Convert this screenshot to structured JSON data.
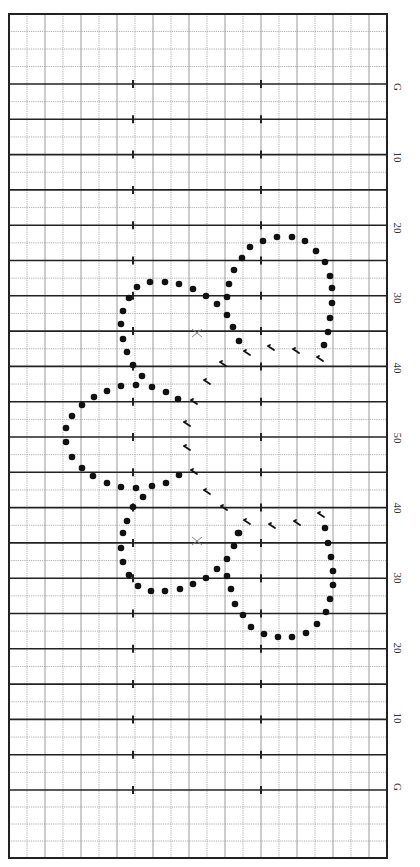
{
  "chart": {
    "type": "stitch-chart",
    "grid": {
      "left": 9,
      "top": 14,
      "right": 387,
      "bottom": 858,
      "column_count": 21,
      "row_top_area": 84,
      "thick_line_start": 84,
      "thick_line_end": 790,
      "thick_line_count": 21,
      "minor_rows_top": 4,
      "minor_rows_bottom": 4,
      "tick_columns_x": [
        133,
        261
      ],
      "colors": {
        "border": "#222222",
        "thick": "#222222",
        "minor": "#9a9a9a",
        "dot": "#111111"
      }
    },
    "row_labels": [
      {
        "text": "G",
        "y": 87
      },
      {
        "text": "10",
        "y": 157
      },
      {
        "text": "20",
        "y": 228
      },
      {
        "text": "30",
        "y": 298
      },
      {
        "text": "40",
        "y": 368
      },
      {
        "text": "50",
        "y": 438
      },
      {
        "text": "40",
        "y": 508
      },
      {
        "text": "30",
        "y": 578
      },
      {
        "text": "20",
        "y": 648
      },
      {
        "text": "10",
        "y": 718
      },
      {
        "text": "G",
        "y": 787
      }
    ],
    "symbols": {
      "dots": [
        [
          263,
          241
        ],
        [
          277,
          237
        ],
        [
          292,
          237
        ],
        [
          305,
          241
        ],
        [
          316,
          251
        ],
        [
          325,
          262
        ],
        [
          330,
          276
        ],
        [
          332,
          288
        ],
        [
          332,
          303
        ],
        [
          330,
          318
        ],
        [
          328,
          332
        ],
        [
          324,
          345
        ],
        [
          250,
          247
        ],
        [
          242,
          258
        ],
        [
          234,
          270
        ],
        [
          229,
          284
        ],
        [
          227,
          297
        ],
        [
          206,
          296
        ],
        [
          217,
          304
        ],
        [
          227,
          315
        ],
        [
          233,
          327
        ],
        [
          239,
          341
        ],
        [
          137,
          287
        ],
        [
          150,
          282
        ],
        [
          165,
          282
        ],
        [
          179,
          284
        ],
        [
          193,
          289
        ],
        [
          129,
          298
        ],
        [
          123,
          311
        ],
        [
          121,
          324
        ],
        [
          123,
          339
        ],
        [
          127,
          352
        ],
        [
          133,
          365
        ],
        [
          142,
          376
        ],
        [
          136,
          385
        ],
        [
          121,
          386
        ],
        [
          107,
          391
        ],
        [
          94,
          397
        ],
        [
          82,
          405
        ],
        [
          72,
          416
        ],
        [
          66,
          428
        ],
        [
          66,
          442
        ],
        [
          72,
          457
        ],
        [
          82,
          468
        ],
        [
          93,
          476
        ],
        [
          107,
          483
        ],
        [
          121,
          487
        ],
        [
          136,
          488
        ],
        [
          152,
          486
        ],
        [
          166,
          483
        ],
        [
          179,
          475
        ],
        [
          152,
          387
        ],
        [
          166,
          392
        ],
        [
          178,
          399
        ],
        [
          143,
          497
        ],
        [
          133,
          507
        ],
        [
          127,
          521
        ],
        [
          123,
          533
        ],
        [
          121,
          548
        ],
        [
          123,
          562
        ],
        [
          129,
          575
        ],
        [
          138,
          586
        ],
        [
          151,
          591
        ],
        [
          165,
          591
        ],
        [
          180,
          589
        ],
        [
          193,
          584
        ],
        [
          206,
          578
        ],
        [
          217,
          569
        ],
        [
          227,
          559
        ],
        [
          234,
          546
        ],
        [
          238,
          533
        ],
        [
          227,
          576
        ],
        [
          231,
          589
        ],
        [
          235,
          604
        ],
        [
          243,
          615
        ],
        [
          251,
          627
        ],
        [
          264,
          634
        ],
        [
          278,
          637
        ],
        [
          292,
          637
        ],
        [
          306,
          633
        ],
        [
          317,
          624
        ],
        [
          326,
          612
        ],
        [
          330,
          599
        ],
        [
          333,
          585
        ],
        [
          333,
          571
        ],
        [
          331,
          557
        ],
        [
          328,
          543
        ],
        [
          325,
          528
        ],
        [
          239,
          533
        ]
      ],
      "hooks": [
        [
          247,
          353
        ],
        [
          271,
          348
        ],
        [
          296,
          351
        ],
        [
          320,
          359
        ],
        [
          223,
          364
        ],
        [
          207,
          382
        ],
        [
          194,
          402
        ],
        [
          187,
          424
        ],
        [
          187,
          448
        ],
        [
          194,
          472
        ],
        [
          207,
          492
        ],
        [
          224,
          508
        ],
        [
          247,
          522
        ],
        [
          272,
          526
        ],
        [
          297,
          523
        ],
        [
          321,
          515
        ]
      ],
      "crosses": [
        [
          197,
          333
        ],
        [
          197,
          541
        ]
      ]
    }
  }
}
